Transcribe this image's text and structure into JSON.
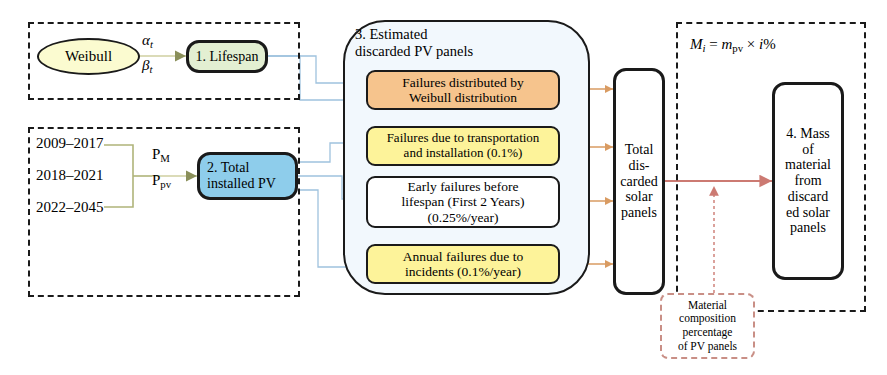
{
  "diagram": {
    "groups": {
      "lifespan_group_label": "",
      "installed_group_label": "",
      "mass_group_label": ""
    },
    "nodes": {
      "weibull": {
        "label": "Weibull",
        "fill": "#fbfbd0",
        "shape": "ellipse"
      },
      "lifespan": {
        "label": "1. Lifespan",
        "fill": "#e3efd2",
        "shape": "rounded-rect"
      },
      "total_installed": {
        "line1": "2. Total",
        "line2": "installed PV",
        "fill": "#8ecdeb",
        "shape": "rounded-rect"
      },
      "estimated_container": {
        "line1": "3. Estimated",
        "line2": "discarded PV panels",
        "fill": "#f2f8fd",
        "shape": "rounded-rect"
      },
      "failure_weibull": {
        "line1": "Failures distributed by",
        "line2": "Weibull distribution",
        "fill": "#f6c48d"
      },
      "failure_transport": {
        "line1": "Failures due to transportation",
        "line2": "and installation (0.1%)",
        "fill": "#fdf39a"
      },
      "failure_early": {
        "line1": "Early failures before",
        "line2": "lifespan (First 2 Years)",
        "line3": "(0.25%/year)",
        "fill": "#ffffff"
      },
      "failure_incidents": {
        "line1": "Annual failures due to",
        "line2": "incidents (0.1%/year)",
        "fill": "#fdf39a"
      },
      "total_discarded": {
        "line1": "Total",
        "line2": "dis-",
        "line3": "carded",
        "line4": "solar",
        "line5": "panels",
        "fill": "#ffffff"
      },
      "mass_material": {
        "line1": "4. Mass",
        "line2": "of",
        "line3": "material",
        "line4": "from",
        "line5": "discard",
        "line6": "ed solar",
        "line7": "panels",
        "fill": "#ffffff"
      },
      "material_composition": {
        "line1": "Material",
        "line2": "composition",
        "line3": "percentage",
        "line4": "of PV panels",
        "fill": "#ffffff"
      }
    },
    "year_ranges": [
      "2009–2017",
      "2018–2021",
      "2022–2045"
    ],
    "edge_labels": {
      "alpha_t": "α",
      "alpha_sub": "t",
      "beta_t": "β",
      "beta_sub": "t",
      "p_m": "P",
      "p_m_sub": "M",
      "p_pv": "P",
      "p_pv_sub": "pv"
    },
    "formula": {
      "lhs": "M",
      "lhs_sub": "i",
      "eq": " = ",
      "rhs_m": "m",
      "rhs_sub": "pv",
      "rhs_rest": " × ",
      "rhs_i": "i",
      "rhs_pct": "%"
    },
    "colors": {
      "connector_blue": "#8fb6d8",
      "connector_orange": "#d99b62",
      "connector_red": "#cc7a72",
      "connector_olive": "#b0b47a",
      "outline_black": "#1a1a1a",
      "dash_red": "#c98f86"
    }
  }
}
